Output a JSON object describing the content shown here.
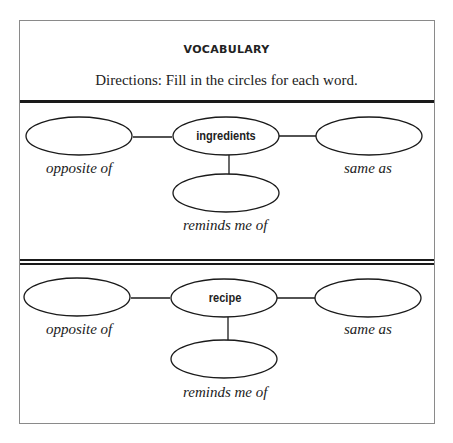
{
  "worksheet": {
    "title": "VOCABULARY",
    "directions": "Directions: Fill in the circles for each word.",
    "organizers": [
      {
        "word": "ingredients",
        "left_label": "opposite of",
        "right_label": "same as",
        "bottom_label": "reminds me of"
      },
      {
        "word": "recipe",
        "left_label": "opposite of",
        "right_label": "same as",
        "bottom_label": "reminds me of"
      }
    ]
  }
}
